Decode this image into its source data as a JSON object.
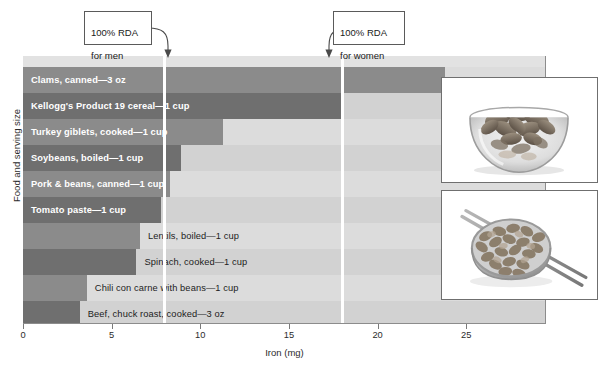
{
  "chart_data": {
    "type": "bar",
    "orientation": "horizontal",
    "title": "",
    "xlabel": "Iron (mg)",
    "ylabel": "Food and serving size",
    "xlim": [
      0,
      29.5
    ],
    "xticks": [
      0,
      5,
      10,
      15,
      20,
      25
    ],
    "xtick_labels": [
      "0",
      "5",
      "10",
      "15",
      "20",
      "25"
    ],
    "grid": false,
    "legend": "none",
    "categories": [
      "Clams, canned—3 oz",
      "Kellogg's Product 19 cereal—1 cup",
      "Turkey giblets, cooked—1 cup",
      "Soybeans, boiled—1 cup",
      "Pork & beans, canned—1 cup",
      "Tomato paste—1 cup",
      "Lentils, boiled—1 cup",
      "Spinach, cooked—1 cup",
      "Chili con carne with beans—1 cup",
      "Beef, chuck roast, cooked—3 oz"
    ],
    "values": [
      23.8,
      18.0,
      11.3,
      8.9,
      8.3,
      7.8,
      6.6,
      6.4,
      3.6,
      3.2
    ],
    "bars": [
      {
        "label": "Clams, canned—3 oz",
        "value": 23.8,
        "label_position": "inside",
        "shade": "mid"
      },
      {
        "label": "Kellogg's Product 19 cereal—1 cup",
        "value": 18.0,
        "label_position": "inside",
        "shade": "dark"
      },
      {
        "label": "Turkey giblets, cooked—1 cup",
        "value": 11.3,
        "label_position": "inside",
        "shade": "mid"
      },
      {
        "label": "Soybeans, boiled—1 cup",
        "value": 8.9,
        "label_position": "inside",
        "shade": "dark"
      },
      {
        "label": "Pork & beans, canned—1 cup",
        "value": 8.3,
        "label_position": "inside",
        "shade": "mid"
      },
      {
        "label": "Tomato paste—1 cup",
        "value": 7.8,
        "label_position": "inside",
        "shade": "dark"
      },
      {
        "label": "Lentils, boiled—1 cup",
        "value": 6.6,
        "label_position": "outside",
        "shade": "mid"
      },
      {
        "label": "Spinach, cooked—1 cup",
        "value": 6.4,
        "label_position": "outside",
        "shade": "dark"
      },
      {
        "label": "Chili con carne with beans—1 cup",
        "value": 3.6,
        "label_position": "outside",
        "shade": "mid"
      },
      {
        "label": "Beef, chuck roast, cooked—3 oz",
        "value": 3.2,
        "label_position": "outside",
        "shade": "dark"
      }
    ],
    "reference_lines": [
      {
        "name": "rda-men",
        "value": 8.0,
        "label": "100% RDA\nfor men",
        "label_line1": "100% RDA",
        "label_line2": "for men",
        "color": "#ffffff"
      },
      {
        "name": "rda-women",
        "value": 18.0,
        "label": "100% RDA\nfor women",
        "label_line1": "100% RDA",
        "label_line2": "for women",
        "color": "#ffffff"
      }
    ]
  },
  "annotations": {
    "men_callout_line1": "100% RDA",
    "men_callout_line2": "for men",
    "women_callout_line1": "100% RDA",
    "women_callout_line2": "for women"
  },
  "photos": [
    {
      "name": "cereal-bowl-photo",
      "caption": ""
    },
    {
      "name": "beans-measuring-cup-photo",
      "caption": ""
    }
  ],
  "colors": {
    "plot_background": "#d9d9d9",
    "plot_top_strip": "#e2e2e2",
    "bar_mid": "#8b8b8b",
    "bar_dark": "#6f6f6f",
    "reference_line": "#ffffff",
    "axis": "#7a7a7a",
    "text": "#2b2b2b",
    "inside_label": "#ffffff",
    "page_background": "#ffffff"
  }
}
